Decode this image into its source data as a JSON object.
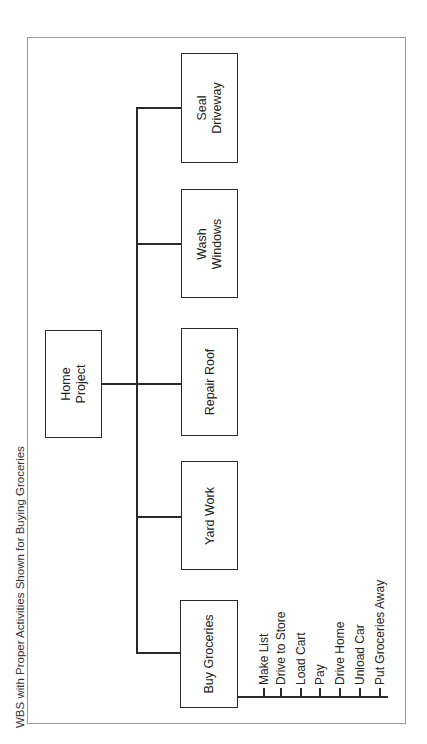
{
  "figure": {
    "title": "WBS with Proper Activities Shown for Buying Groceries"
  },
  "wbs": {
    "root": {
      "label": "Home\nProject"
    },
    "children": [
      {
        "label": "Buy Groceries"
      },
      {
        "label": "Yard Work"
      },
      {
        "label": "Repair Roof"
      },
      {
        "label": "Wash\nWindows"
      },
      {
        "label": "Seal\nDriveway"
      }
    ],
    "activities_parent": "Buy Groceries",
    "activities": [
      "Make List",
      "Drive to Store",
      "Load Cart",
      "Pay",
      "Drive Home",
      "Unload Car",
      "Put Groceries Away"
    ]
  },
  "colors": {
    "line": "#2a2a2a",
    "frame": "#9a9a9a",
    "background": "#ffffff"
  }
}
